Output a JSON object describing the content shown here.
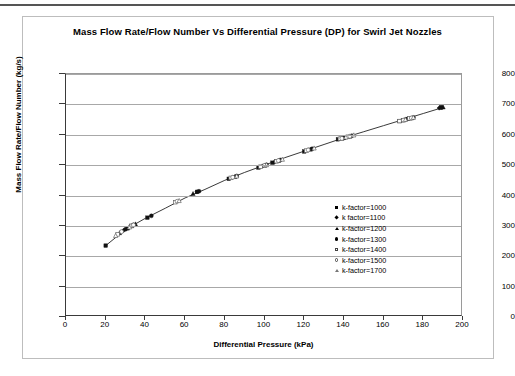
{
  "chart_data": {
    "type": "scatter",
    "title": "Mass Flow Rate/Flow Number Vs Differential Pressure (DP) for Swirl Jet Nozzles",
    "xlabel": "Differential Pressure (kPa)",
    "ylabel": "Mass Flow Rate/Flow Number (kg/s)",
    "xlim": [
      0,
      200
    ],
    "ylim": [
      0,
      800
    ],
    "xticks": [
      0,
      20,
      40,
      60,
      80,
      100,
      120,
      140,
      160,
      180,
      200
    ],
    "yticks": [
      0,
      100,
      200,
      300,
      400,
      500,
      600,
      700,
      800
    ],
    "grid": "horizontal",
    "legend_position": "inside-right",
    "series": [
      {
        "name": "k-factor=1000",
        "marker": "filled-square",
        "points": [
          [
            20,
            235
          ],
          [
            31,
            292
          ],
          [
            33,
            300
          ],
          [
            41,
            327
          ],
          [
            66,
            412
          ],
          [
            82,
            455
          ],
          [
            97,
            492
          ],
          [
            104,
            508
          ],
          [
            106,
            513
          ],
          [
            120,
            545
          ],
          [
            137,
            585
          ],
          [
            140,
            590
          ],
          [
            142,
            593
          ],
          [
            168,
            645
          ],
          [
            172,
            652
          ],
          [
            189,
            690
          ]
        ]
      },
      {
        "name": "k factor=1100",
        "marker": "filled-diamond",
        "points": [
          [
            29,
            285
          ],
          [
            32,
            296
          ],
          [
            34,
            303
          ],
          [
            66,
            412
          ],
          [
            84,
            460
          ],
          [
            99,
            497
          ],
          [
            105,
            510
          ],
          [
            122,
            550
          ],
          [
            138,
            587
          ],
          [
            141,
            592
          ],
          [
            169,
            647
          ],
          [
            173,
            654
          ],
          [
            188,
            688
          ]
        ]
      },
      {
        "name": "k-factor=1200",
        "marker": "filled-triangle",
        "points": [
          [
            27,
            277
          ],
          [
            33,
            300
          ],
          [
            35,
            306
          ],
          [
            64,
            406
          ],
          [
            85,
            462
          ],
          [
            100,
            499
          ],
          [
            107,
            515
          ],
          [
            123,
            552
          ],
          [
            139,
            588
          ],
          [
            143,
            595
          ],
          [
            170,
            648
          ],
          [
            174,
            655
          ],
          [
            190,
            691
          ]
        ]
      },
      {
        "name": "k-factor=1300",
        "marker": "filled-circle",
        "points": [
          [
            30,
            289
          ],
          [
            34,
            303
          ],
          [
            43,
            333
          ],
          [
            67,
            414
          ],
          [
            86,
            464
          ],
          [
            101,
            501
          ],
          [
            108,
            517
          ],
          [
            124,
            554
          ],
          [
            140,
            590
          ],
          [
            144,
            597
          ],
          [
            171,
            650
          ],
          [
            175,
            657
          ],
          [
            189,
            690
          ]
        ]
      },
      {
        "name": "k-factor=1400",
        "marker": "open-square",
        "points": [
          [
            26,
            272
          ],
          [
            33,
            300
          ],
          [
            55,
            378
          ],
          [
            83,
            458
          ],
          [
            98,
            495
          ],
          [
            106,
            513
          ],
          [
            121,
            548
          ],
          [
            138,
            587
          ],
          [
            142,
            593
          ],
          [
            168,
            645
          ],
          [
            173,
            654
          ]
        ]
      },
      {
        "name": "k-factor=1500",
        "marker": "open-circle",
        "points": [
          [
            28,
            281
          ],
          [
            34,
            303
          ],
          [
            56,
            381
          ],
          [
            84,
            460
          ],
          [
            100,
            499
          ],
          [
            107,
            515
          ],
          [
            122,
            550
          ],
          [
            139,
            588
          ],
          [
            143,
            595
          ],
          [
            170,
            648
          ],
          [
            174,
            655
          ]
        ]
      },
      {
        "name": "k-factor=1700",
        "marker": "open-triangle",
        "points": [
          [
            25,
            268
          ],
          [
            32,
            296
          ],
          [
            57,
            383
          ],
          [
            86,
            464
          ],
          [
            101,
            501
          ],
          [
            109,
            519
          ],
          [
            125,
            556
          ],
          [
            141,
            592
          ],
          [
            145,
            599
          ],
          [
            171,
            650
          ],
          [
            175,
            657
          ]
        ]
      }
    ],
    "trend_curve": [
      [
        20,
        235
      ],
      [
        30,
        288
      ],
      [
        40,
        325
      ],
      [
        50,
        358
      ],
      [
        60,
        392
      ],
      [
        70,
        420
      ],
      [
        80,
        450
      ],
      [
        90,
        476
      ],
      [
        100,
        500
      ],
      [
        110,
        524
      ],
      [
        120,
        546
      ],
      [
        130,
        568
      ],
      [
        140,
        590
      ],
      [
        150,
        610
      ],
      [
        160,
        630
      ],
      [
        170,
        650
      ],
      [
        180,
        670
      ],
      [
        190,
        690
      ]
    ]
  }
}
